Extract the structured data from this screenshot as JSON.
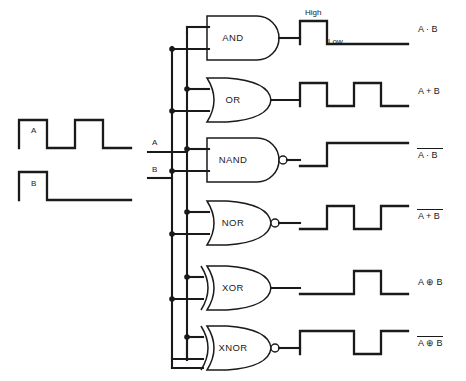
{
  "inputs": {
    "signals": [
      {
        "name": "A",
        "label": "A",
        "pattern": [
          1,
          0,
          1,
          0
        ]
      },
      {
        "name": "B",
        "label": "B",
        "pattern": [
          1,
          0,
          0,
          0
        ]
      }
    ]
  },
  "bus": {
    "a_label": "A",
    "b_label": "B"
  },
  "levels": {
    "high_label": "High",
    "low_label": "Low"
  },
  "gates": [
    {
      "id": "and",
      "label": "AND",
      "shape": "and",
      "inverted": false,
      "output_expr": "A · B",
      "expr_parts": [
        {
          "text": "A · B",
          "bar": false
        }
      ],
      "waveform": [
        1,
        0,
        0,
        0
      ]
    },
    {
      "id": "or",
      "label": "OR",
      "shape": "or",
      "inverted": false,
      "output_expr": "A + B",
      "expr_parts": [
        {
          "text": "A + B",
          "bar": false
        }
      ],
      "waveform": [
        1,
        0,
        1,
        0
      ]
    },
    {
      "id": "nand",
      "label": "NAND",
      "shape": "and",
      "inverted": true,
      "output_expr": "A · B (overbar)",
      "expr_parts": [
        {
          "text": "A · B",
          "bar": true
        }
      ],
      "waveform": [
        0,
        1,
        1,
        1
      ]
    },
    {
      "id": "nor",
      "label": "NOR",
      "shape": "or",
      "inverted": true,
      "output_expr": "A + B (overbar)",
      "expr_parts": [
        {
          "text": "A + B",
          "bar": true
        }
      ],
      "waveform": [
        0,
        1,
        0,
        1
      ]
    },
    {
      "id": "xor",
      "label": "XOR",
      "shape": "xor",
      "inverted": false,
      "output_expr": "A ⊕ B",
      "expr_parts": [
        {
          "text": "A ⊕ B",
          "bar": false
        }
      ],
      "waveform": [
        0,
        0,
        1,
        0
      ]
    },
    {
      "id": "xnor",
      "label": "XNOR",
      "shape": "xor",
      "inverted": true,
      "output_expr": "A ⊕ B (overbar)",
      "expr_parts": [
        {
          "text": "A ⊕ B",
          "bar": true
        }
      ],
      "waveform": [
        1,
        1,
        0,
        1
      ]
    }
  ],
  "colors": {
    "line": "#1a1a1a",
    "background": "#ffffff",
    "gate_fill": "#ffffff"
  }
}
